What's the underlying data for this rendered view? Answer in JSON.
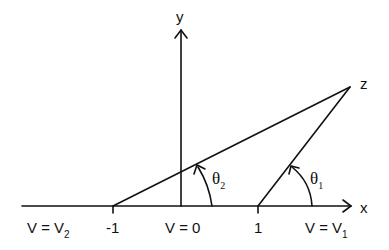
{
  "diagram": {
    "axes": {
      "x_label": "x",
      "y_label": "y"
    },
    "ticks": {
      "minus_one": "-1",
      "one": "1"
    },
    "regions": {
      "left": {
        "prefix": "V = V",
        "sub": "2"
      },
      "middle": {
        "text": "V = 0"
      },
      "right": {
        "prefix": "V = V",
        "sub": "1"
      }
    },
    "point": {
      "label": "z"
    },
    "angles": {
      "theta1": {
        "symbol": "θ",
        "sub": "1"
      },
      "theta2": {
        "symbol": "θ",
        "sub": "2"
      }
    },
    "colors": {
      "stroke": "#111111",
      "background": "#ffffff"
    }
  }
}
